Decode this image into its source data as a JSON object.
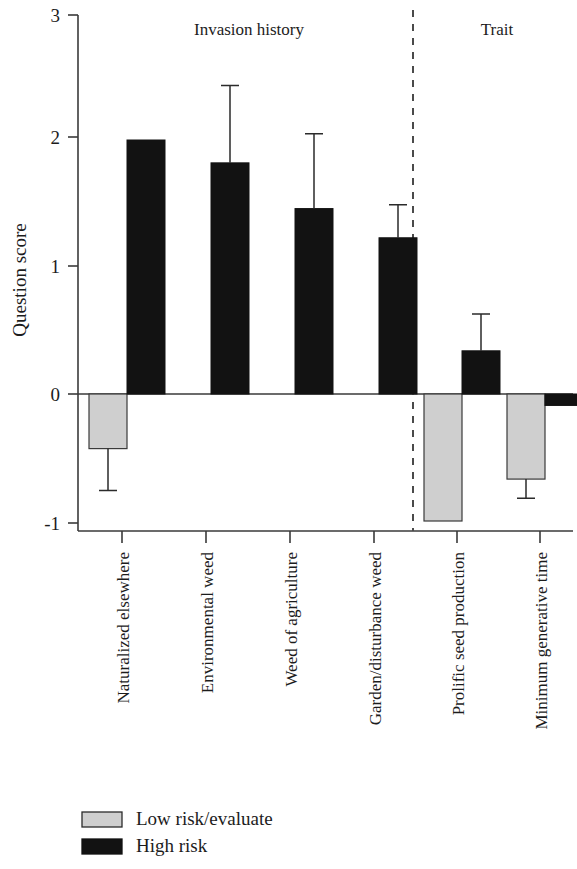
{
  "chart_data": {
    "type": "bar",
    "title": "",
    "subtitle": "",
    "xlabel": "",
    "ylabel": "Question score",
    "ylim": [
      -1,
      3
    ],
    "ytick_labels": [
      "3",
      "2",
      "1",
      "0",
      "-1"
    ],
    "ytick_values": [
      3,
      2,
      1,
      0,
      -1
    ],
    "grid": false,
    "orientation": "vertical",
    "zero_line": 0,
    "legend_position": "bottom-left",
    "categories": [
      "Naturalized elsewhere",
      "Environmental weed",
      "Weed of agriculture",
      "Garden/disturbance weed",
      "Prolific seed production",
      "Minimum generative time"
    ],
    "group_headers": [
      {
        "label": "Invasion history",
        "categories": [
          0,
          1,
          2,
          3
        ]
      },
      {
        "label": "Trait",
        "categories": [
          4,
          5
        ]
      }
    ],
    "group_divider_after_category": 3,
    "series": [
      {
        "name": "Low risk/evaluate",
        "color": "#cfcfcf",
        "edge_color": "#3a3a3a",
        "values": [
          -0.43,
          null,
          null,
          null,
          -1.0,
          -0.67
        ],
        "errors_upper": [
          null,
          null,
          null,
          null,
          null,
          null
        ],
        "errors_lower": [
          -0.76,
          null,
          null,
          null,
          null,
          -0.82
        ]
      },
      {
        "name": "High risk",
        "color": "#121212",
        "edge_color": "#121212",
        "values": [
          2.0,
          1.82,
          1.46,
          1.23,
          0.34,
          -0.09
        ],
        "errors_upper": [
          null,
          2.43,
          2.05,
          1.49,
          0.63,
          null
        ],
        "errors_lower": [
          null,
          null,
          null,
          null,
          null,
          -0.31
        ]
      }
    ]
  },
  "legend": {
    "items": [
      {
        "label": "Low risk/evaluate",
        "swatch": "low-risk-swatch"
      },
      {
        "label": "High risk",
        "swatch": "high-risk-swatch"
      }
    ]
  }
}
